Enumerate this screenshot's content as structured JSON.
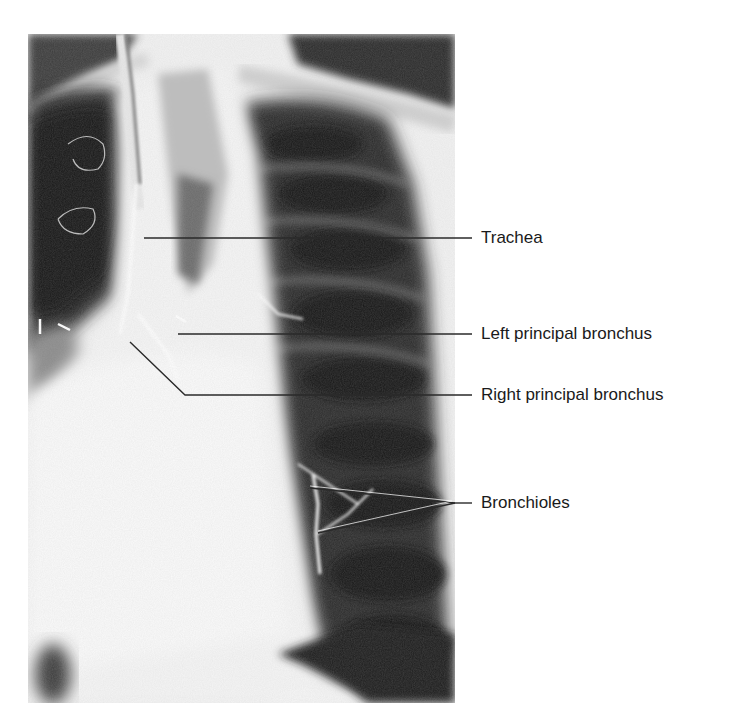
{
  "figure": {
    "type": "chest radiograph (bronchogram)",
    "image_region": {
      "x": 28,
      "y": 34,
      "width": 427,
      "height": 669
    },
    "colors": {
      "background": "#ffffff",
      "label_text": "#1a1a1a",
      "leader_line": "#2a2a2a"
    }
  },
  "labels": [
    {
      "id": "trachea",
      "text": "Trachea",
      "y": 238
    },
    {
      "id": "left-principal-bronchus",
      "text": "Left principal bronchus",
      "y": 334
    },
    {
      "id": "right-principal-bronchus",
      "text": "Right principal bronchus",
      "y": 395
    },
    {
      "id": "bronchioles",
      "text": "Bronchioles",
      "y": 503
    }
  ]
}
